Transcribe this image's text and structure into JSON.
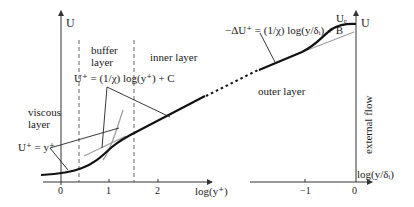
{
  "diagram": {
    "type": "turbulent boundary layer mean velocity profile",
    "left_axis": {
      "y_label": "U",
      "x_label": "log(y⁺)",
      "x_ticks": [
        "0",
        "1",
        "2"
      ]
    },
    "right_axis": {
      "y_label": "U",
      "x_label": "log(y/δᵢ)",
      "x_ticks": [
        "−1",
        "0"
      ],
      "edge_velocity_label": "Uₑ"
    },
    "regions": {
      "viscous": [
        "viscous",
        "layer"
      ],
      "buffer": [
        "buffer",
        "layer"
      ],
      "inner": "inner layer",
      "outer": "outer layer",
      "external": "external flow"
    },
    "equations": {
      "viscous_law": "U⁺ = y⁺",
      "log_law": "U⁺ = (1/χ) log(y⁺) + C",
      "defect_law": "−ΔU⁺ = (1/χ) log(y/δᵢ) + B"
    },
    "colors": {
      "profile": "#111111",
      "asymptote": "#a0a0a0",
      "axis": "#333333",
      "dashed": "#555555"
    }
  }
}
